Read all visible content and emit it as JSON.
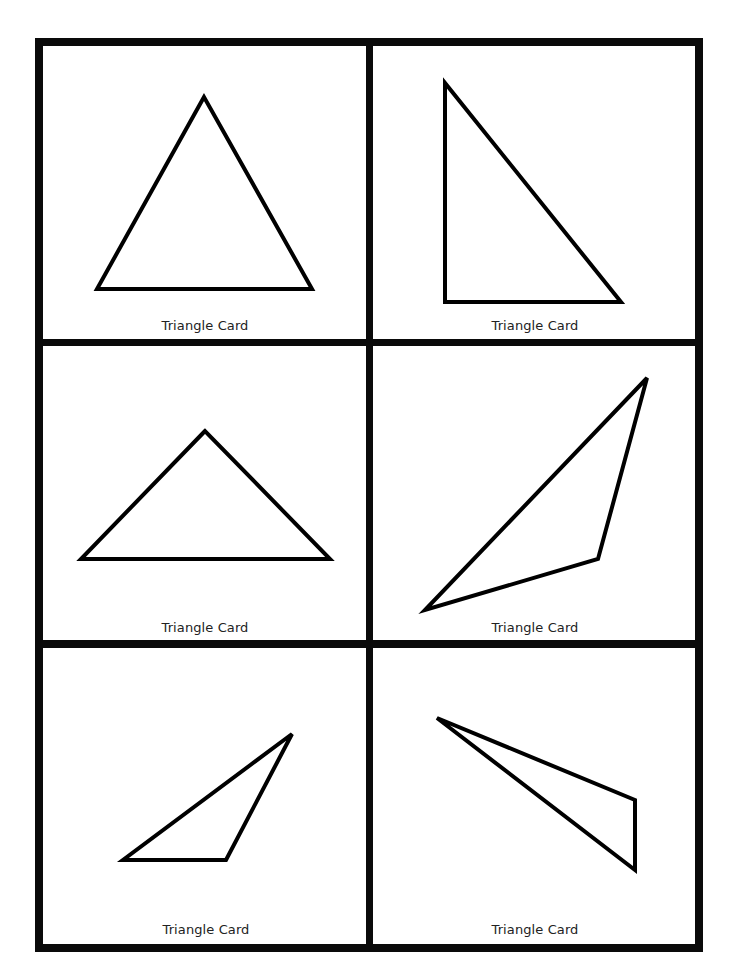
{
  "sheet": {
    "title": "Triangle Cards",
    "frame": {
      "left": 35,
      "top": 38,
      "right": 703,
      "bottom": 952,
      "thickness": 8,
      "color": "#0a0a0a"
    },
    "grid": {
      "columns": 2,
      "rows": 3,
      "vertical_divider_x": 366,
      "horizontal_dividers_y": [
        339,
        640
      ]
    }
  },
  "cards": [
    {
      "label": "Triangle Card",
      "type": "equilateral",
      "points": "204,97 97,289 312,289",
      "label_x": 205,
      "label_y": 319
    },
    {
      "label": "Triangle Card",
      "type": "right",
      "points": "445,83 445,302 621,302",
      "label_x": 535,
      "label_y": 319
    },
    {
      "label": "Triangle Card",
      "type": "isosceles-obtuse",
      "points": "205,431 81,559 330,559",
      "label_x": 205,
      "label_y": 621
    },
    {
      "label": "Triangle Card",
      "type": "scalene-obtuse",
      "points": "647,378 598,559 425,610",
      "label_x": 535,
      "label_y": 621
    },
    {
      "label": "Triangle Card",
      "type": "scalene-obtuse",
      "points": "292,734 226,860 123,860",
      "label_x": 206,
      "label_y": 923
    },
    {
      "label": "Triangle Card",
      "type": "scalene-obtuse",
      "points": "437,718 635,800 635,870",
      "label_x": 535,
      "label_y": 923
    }
  ],
  "style": {
    "stroke_color": "#000000",
    "stroke_width": 4,
    "background": "#ffffff"
  }
}
